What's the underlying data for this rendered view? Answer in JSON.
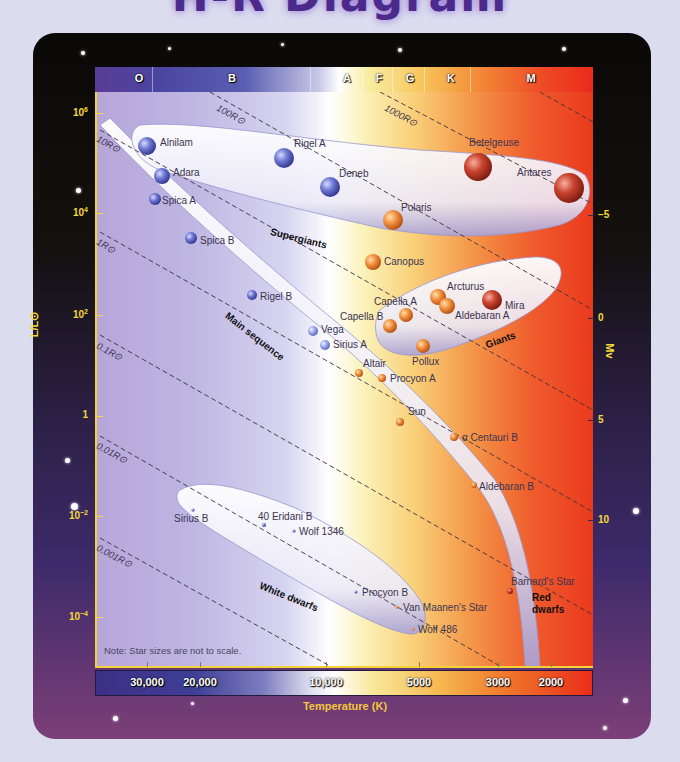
{
  "title": "H-R Diagram",
  "chart_data": {
    "type": "scatter",
    "title": "H-R Diagram",
    "xlabel": "Temperature (K)",
    "ylabel": "L/L⊙",
    "ylabel_right": "Mv",
    "x_scale": "log, reversed",
    "y_scale": "log",
    "xlim": [
      40000,
      1800
    ],
    "ylim": [
      1e-05,
      3000000
    ],
    "x_ticks": [
      "30,000",
      "20,000",
      "10,000",
      "5000",
      "3000",
      "2000"
    ],
    "y_ticks": [
      "10^6",
      "10^4",
      "10^2",
      "1",
      "10^-2",
      "10^-4"
    ],
    "y_right_ticks": [
      "-5",
      "0",
      "5",
      "10"
    ],
    "spectral_classes": [
      "O",
      "B",
      "A",
      "F",
      "G",
      "K",
      "M"
    ],
    "radius_lines": [
      "1000R⊙",
      "100R⊙",
      "10R⊙",
      "1R⊙",
      "0.1R⊙",
      "0.01R⊙",
      "0.001R⊙"
    ],
    "regions": [
      "Supergiants",
      "Giants",
      "Main sequence",
      "White dwarfs",
      "Red dwarfs"
    ],
    "grid": false,
    "legend": "none",
    "stars": [
      {
        "name": "Alnilam",
        "temperature_K": 27000,
        "luminosity": 375000,
        "group": "Supergiants"
      },
      {
        "name": "Adara",
        "temperature_K": 22000,
        "luminosity": 40000,
        "group": "Supergiants"
      },
      {
        "name": "Rigel A",
        "temperature_K": 12000,
        "luminosity": 120000,
        "group": "Supergiants"
      },
      {
        "name": "Deneb",
        "temperature_K": 9000,
        "luminosity": 60000,
        "group": "Supergiants"
      },
      {
        "name": "Betelgeuse",
        "temperature_K": 3500,
        "luminosity": 200000,
        "group": "Supergiants"
      },
      {
        "name": "Antares",
        "temperature_K": 3100,
        "luminosity": 65000,
        "group": "Supergiants"
      },
      {
        "name": "Polaris",
        "temperature_K": 6000,
        "luminosity": 2500,
        "group": "Supergiants"
      },
      {
        "name": "Canopus",
        "temperature_K": 7300,
        "luminosity": 1400,
        "group": "Giants"
      },
      {
        "name": "Arcturus",
        "temperature_K": 4300,
        "luminosity": 170,
        "group": "Giants"
      },
      {
        "name": "Mira",
        "temperature_K": 3000,
        "luminosity": 150,
        "group": "Giants"
      },
      {
        "name": "Aldebaran A",
        "temperature_K": 4100,
        "luminosity": 140,
        "group": "Giants"
      },
      {
        "name": "Capella A",
        "temperature_K": 5000,
        "luminosity": 80,
        "group": "Giants"
      },
      {
        "name": "Capella B",
        "temperature_K": 5700,
        "luminosity": 70,
        "group": "Giants"
      },
      {
        "name": "Pollux",
        "temperature_K": 4800,
        "luminosity": 32,
        "group": "Giants"
      },
      {
        "name": "Spica A",
        "temperature_K": 25000,
        "luminosity": 12000,
        "group": "Main sequence"
      },
      {
        "name": "Spica B",
        "temperature_K": 20000,
        "luminosity": 1500,
        "group": "Main sequence"
      },
      {
        "name": "Rigel B",
        "temperature_K": 12500,
        "luminosity": 150,
        "group": "Main sequence"
      },
      {
        "name": "Vega",
        "temperature_K": 9600,
        "luminosity": 40,
        "group": "Main sequence"
      },
      {
        "name": "Sirius A",
        "temperature_K": 9100,
        "luminosity": 25,
        "group": "Main sequence"
      },
      {
        "name": "Altair",
        "temperature_K": 7500,
        "luminosity": 10,
        "group": "Main sequence"
      },
      {
        "name": "Procyon A",
        "temperature_K": 6500,
        "luminosity": 7,
        "group": "Main sequence"
      },
      {
        "name": "Sun",
        "temperature_K": 5800,
        "luminosity": 1,
        "group": "Main sequence"
      },
      {
        "name": "α Centauri B",
        "temperature_K": 4500,
        "luminosity": 0.5,
        "group": "Main sequence"
      },
      {
        "name": "Aldebaran B",
        "temperature_K": 4000,
        "luminosity": 0.04,
        "group": "Main sequence"
      },
      {
        "name": "Barnard's Star",
        "temperature_K": 3100,
        "luminosity": 0.0004,
        "group": "Red dwarfs"
      },
      {
        "name": "Sirius B",
        "temperature_K": 25000,
        "luminosity": 0.025,
        "group": "White dwarfs"
      },
      {
        "name": "40 Eridani B",
        "temperature_K": 16500,
        "luminosity": 0.01,
        "group": "White dwarfs"
      },
      {
        "name": "Wolf 1346",
        "temperature_K": 14000,
        "luminosity": 0.006,
        "group": "White dwarfs"
      },
      {
        "name": "Procyon B",
        "temperature_K": 7700,
        "luminosity": 0.0005,
        "group": "White dwarfs"
      },
      {
        "name": "Van Maanen's Star",
        "temperature_K": 6000,
        "luminosity": 0.00017,
        "group": "White dwarfs"
      },
      {
        "name": "Wolf 486",
        "temperature_K": 5500,
        "luminosity": 6e-05,
        "group": "White dwarfs"
      }
    ],
    "note": "Note: Star sizes are not to scale."
  },
  "axes": {
    "x_title": "Temperature (K)",
    "y_title": "L/L⊙",
    "y_right_title": "Mv",
    "x_ticks": [
      {
        "label": "30,000",
        "x": 147
      },
      {
        "label": "20,000",
        "x": 200
      },
      {
        "label": "10,000",
        "x": 326
      },
      {
        "label": "5000",
        "x": 419
      },
      {
        "label": "3000",
        "x": 498
      },
      {
        "label": "2000",
        "x": 551
      }
    ],
    "y_ticks": [
      {
        "base": "10",
        "exp": "6",
        "y": 113
      },
      {
        "base": "10",
        "exp": "4",
        "y": 213
      },
      {
        "base": "10",
        "exp": "2",
        "y": 315
      },
      {
        "base": "1",
        "exp": "",
        "y": 416
      },
      {
        "base": "10",
        "exp": "−2",
        "y": 516
      },
      {
        "base": "10",
        "exp": "−4",
        "y": 617
      }
    ],
    "y_right_ticks": [
      {
        "label": "−5",
        "y": 215
      },
      {
        "label": "0",
        "y": 318
      },
      {
        "label": "5",
        "y": 420
      },
      {
        "label": "10",
        "y": 520
      }
    ]
  },
  "spectral_bar": [
    {
      "label": "O",
      "x": 139
    },
    {
      "label": "B",
      "x": 232
    },
    {
      "label": "A",
      "x": 347
    },
    {
      "label": "F",
      "x": 379
    },
    {
      "label": "G",
      "x": 410
    },
    {
      "label": "K",
      "x": 451
    },
    {
      "label": "M",
      "x": 531
    }
  ],
  "radius_lines": [
    {
      "label": "1000R⊙",
      "x": 388,
      "y": 102
    },
    {
      "label": "100R⊙",
      "x": 220,
      "y": 102
    },
    {
      "label": "10R⊙",
      "x": 100,
      "y": 133
    },
    {
      "label": "1R⊙",
      "x": 100,
      "y": 236
    },
    {
      "label": "0.1R⊙",
      "x": 100,
      "y": 340
    },
    {
      "label": "0.01R⊙",
      "x": 100,
      "y": 440
    },
    {
      "label": "0.001R⊙",
      "x": 100,
      "y": 542
    }
  ],
  "regions": [
    {
      "label": "Supergiants",
      "x": 272,
      "y": 226,
      "rot": 14
    },
    {
      "label": "Giants",
      "x": 484,
      "y": 340,
      "rot": -20
    },
    {
      "label": "Main sequence",
      "x": 230,
      "y": 310,
      "rot": 38
    },
    {
      "label": "White dwarfs",
      "x": 262,
      "y": 580,
      "rot": 22
    },
    {
      "label": "Red dwarfs",
      "x": 532,
      "y": 592,
      "rot": 0
    }
  ],
  "stars": [
    {
      "name": "Alnilam",
      "cx": 147,
      "cy": 146,
      "r": 9,
      "color": "blue",
      "lx": 160,
      "ly": 137
    },
    {
      "name": "Adara",
      "cx": 162,
      "cy": 176,
      "r": 8,
      "color": "blue",
      "lx": 173,
      "ly": 167
    },
    {
      "name": "Spica A",
      "cx": 155,
      "cy": 199,
      "r": 6,
      "color": "blue",
      "lx": 162,
      "ly": 195
    },
    {
      "name": "Spica B",
      "cx": 191,
      "cy": 238,
      "r": 6,
      "color": "blue",
      "lx": 200,
      "ly": 235
    },
    {
      "name": "Rigel A",
      "cx": 284,
      "cy": 158,
      "r": 10,
      "color": "blue",
      "lx": 294,
      "ly": 138
    },
    {
      "name": "Deneb",
      "cx": 330,
      "cy": 187,
      "r": 10,
      "color": "blue",
      "lx": 339,
      "ly": 168
    },
    {
      "name": "Polaris",
      "cx": 393,
      "cy": 220,
      "r": 10,
      "color": "orange",
      "lx": 401,
      "ly": 202
    },
    {
      "name": "Betelgeuse",
      "cx": 478,
      "cy": 167,
      "r": 14,
      "color": "red",
      "lx": 469,
      "ly": 137
    },
    {
      "name": "Antares",
      "cx": 569,
      "cy": 188,
      "r": 15,
      "color": "red",
      "lx": 517,
      "ly": 167
    },
    {
      "name": "Canopus",
      "cx": 373,
      "cy": 262,
      "r": 8,
      "color": "orange",
      "lx": 384,
      "ly": 256
    },
    {
      "name": "Arcturus",
      "cx": 438,
      "cy": 297,
      "r": 8,
      "color": "orange",
      "lx": 447,
      "ly": 281
    },
    {
      "name": "Aldebaran A",
      "cx": 447,
      "cy": 306,
      "r": 8,
      "color": "orange",
      "lx": 455,
      "ly": 310
    },
    {
      "name": "Mira",
      "cx": 492,
      "cy": 300,
      "r": 10,
      "color": "red",
      "lx": 505,
      "ly": 300
    },
    {
      "name": "Capella A",
      "cx": 406,
      "cy": 315,
      "r": 7,
      "color": "orange",
      "lx": 374,
      "ly": 296
    },
    {
      "name": "Capella B",
      "cx": 390,
      "cy": 326,
      "r": 7,
      "color": "orange",
      "lx": 340,
      "ly": 311
    },
    {
      "name": "Pollux",
      "cx": 423,
      "cy": 346,
      "r": 7,
      "color": "orange",
      "lx": 412,
      "ly": 356
    },
    {
      "name": "Rigel B",
      "cx": 252,
      "cy": 295,
      "r": 5,
      "color": "blue",
      "lx": 260,
      "ly": 291
    },
    {
      "name": "Vega",
      "cx": 313,
      "cy": 331,
      "r": 5,
      "color": "lightblue",
      "lx": 321,
      "ly": 324
    },
    {
      "name": "Sirius A",
      "cx": 325,
      "cy": 345,
      "r": 5,
      "color": "lightblue",
      "lx": 333,
      "ly": 339
    },
    {
      "name": "Altair",
      "cx": 359,
      "cy": 373,
      "r": 4,
      "color": "orange",
      "lx": 363,
      "ly": 358
    },
    {
      "name": "Procyon A",
      "cx": 382,
      "cy": 378,
      "r": 4,
      "color": "orange",
      "lx": 390,
      "ly": 373
    },
    {
      "name": "Sun",
      "cx": 400,
      "cy": 422,
      "r": 4,
      "color": "orange",
      "lx": 408,
      "ly": 406
    },
    {
      "name": "α Centauri B",
      "cx": 454,
      "cy": 437,
      "r": 4,
      "color": "orange",
      "lx": 462,
      "ly": 432
    },
    {
      "name": "Aldebaran B",
      "cx": 474,
      "cy": 485,
      "r": 3,
      "color": "orange",
      "lx": 479,
      "ly": 481
    },
    {
      "name": "Barnard's Star",
      "cx": 510,
      "cy": 591,
      "r": 3,
      "color": "red",
      "lx": 511,
      "ly": 576
    },
    {
      "name": "Sirius B",
      "cx": 193,
      "cy": 510,
      "r": 1.5,
      "color": "blue",
      "lx": 174,
      "ly": 513
    },
    {
      "name": "40 Eridani B",
      "cx": 264,
      "cy": 525,
      "r": 2,
      "color": "blue",
      "lx": 258,
      "ly": 511
    },
    {
      "name": "Wolf 1346",
      "cx": 294,
      "cy": 531,
      "r": 1.5,
      "color": "blue",
      "lx": 299,
      "ly": 526
    },
    {
      "name": "Procyon B",
      "cx": 356,
      "cy": 592,
      "r": 1.5,
      "color": "blue",
      "lx": 362,
      "ly": 587
    },
    {
      "name": "Van Maanen's Star",
      "cx": 397,
      "cy": 607,
      "r": 1.5,
      "color": "orange",
      "lx": 403,
      "ly": 602
    },
    {
      "name": "Wolf 486",
      "cx": 413,
      "cy": 629,
      "r": 1.5,
      "color": "orange",
      "lx": 418,
      "ly": 624
    }
  ],
  "note": "Note: Star sizes are not to scale."
}
